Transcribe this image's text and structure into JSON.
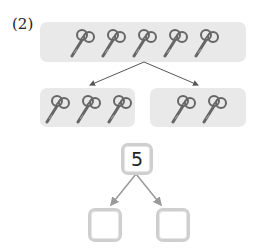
{
  "problem": {
    "label": "(2)",
    "whole_count": 5,
    "parts": [
      3,
      2
    ],
    "object_icon": "scissors-icon"
  },
  "number_bond": {
    "top": "5",
    "left": "",
    "right": ""
  },
  "colors": {
    "box_bg": "#e9e9e9",
    "arrow": "#555555",
    "bond_border": "#cfcfcf"
  }
}
